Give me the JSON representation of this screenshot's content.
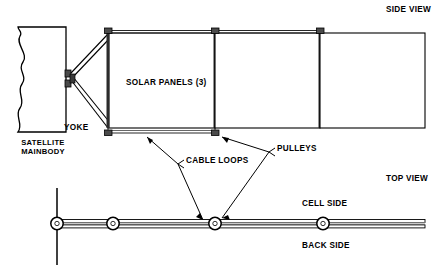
{
  "diagram": {
    "title_side_view": "SIDE VIEW",
    "title_top_view": "TOP VIEW",
    "labels": {
      "solar_panels": "SOLAR PANELS (3)",
      "yoke": "YOKE",
      "satellite_mainbody_line1": "SATELLITE",
      "satellite_mainbody_line2": "MAINBODY",
      "cable_loops": "CABLE LOOPS",
      "pulleys": "PULLEYS",
      "cell_side": "CELL SIDE",
      "back_side": "BACK SIDE"
    },
    "colors": {
      "stroke": "#000000",
      "background": "#ffffff",
      "fill_block": "#555555",
      "fill_light": "#e8e8e8"
    },
    "geometry": {
      "mainbody": {
        "x": 18,
        "y": 27,
        "width": 48,
        "height": 105
      },
      "panels": [
        {
          "name": "panel-1",
          "x": 108,
          "y": 33,
          "width": 107,
          "height": 95
        },
        {
          "name": "panel-2",
          "x": 215,
          "y": 33,
          "width": 105,
          "height": 95
        },
        {
          "name": "panel-3",
          "x": 320,
          "y": 33,
          "width": 105,
          "height": 95
        }
      ],
      "pulleys_side_top": [
        108,
        215,
        320
      ],
      "pulleys_side_bottom": [
        108,
        215
      ],
      "top_view_bar": {
        "x1": 57,
        "x2": 425,
        "y": 224,
        "thickness": 9
      },
      "top_view_pulleys": [
        57,
        113,
        215,
        323
      ],
      "top_view_axis": {
        "x": 57,
        "y1": 188,
        "y2": 265
      }
    }
  }
}
